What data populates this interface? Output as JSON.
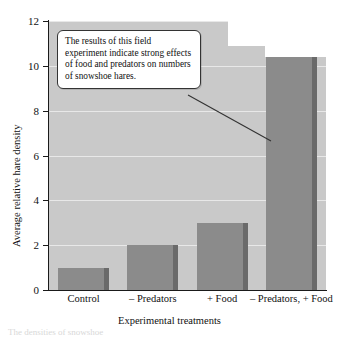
{
  "chart_data": {
    "type": "bar",
    "title": "",
    "xlabel": "Experimental treatments",
    "ylabel": "Average relative hare density",
    "categories": [
      "Control",
      "– Predators",
      "+ Food",
      "– Predators, + Food"
    ],
    "values": [
      1,
      2,
      3,
      11
    ],
    "ylim": [
      0,
      12
    ],
    "yticks": [
      0,
      2,
      4,
      6,
      8,
      10,
      12
    ],
    "ytick_labels": [
      "0",
      "2",
      "4",
      "6",
      "8",
      "10",
      "12"
    ],
    "grid": true,
    "legend": "none",
    "series": [
      {
        "name": "Average relative hare density",
        "values": [
          1,
          2,
          3,
          11
        ]
      }
    ],
    "annotations": [
      {
        "type": "callout",
        "text": "The results of this field experiment indicate strong effects of food and predators on numbers of snowshoe hares.",
        "points_to": "– Predators, + Food"
      }
    ],
    "colors": {
      "bar_fill": "#8b8b8b",
      "bar_shadow": "#6a6a6a",
      "plot_background": "#c9c9c9",
      "gridline": "#e8e8e8",
      "axis": "#1a1a1a",
      "callout_background": "#ffffff",
      "callout_border": "#333333"
    }
  },
  "caption": {
    "text": "The densities of snowshoe"
  }
}
